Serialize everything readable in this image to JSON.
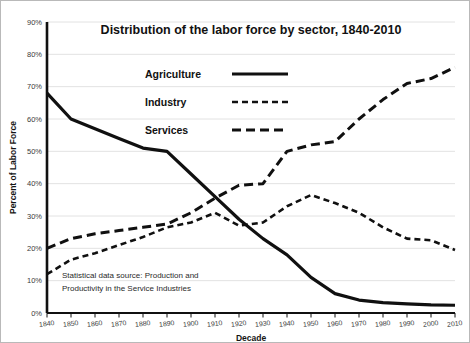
{
  "chart_data": {
    "type": "line",
    "title": "Distribution of the labor force by sector, 1840-2010",
    "xlabel": "Decade",
    "ylabel": "Percent of Labor Force",
    "xlim": [
      1840,
      2010
    ],
    "ylim": [
      0,
      90
    ],
    "ytick_step": 10,
    "grid": true,
    "legend_position": "center-top",
    "x": [
      1840,
      1850,
      1860,
      1870,
      1880,
      1890,
      1900,
      1910,
      1920,
      1930,
      1940,
      1950,
      1960,
      1970,
      1980,
      1990,
      2000,
      2010
    ],
    "xtick_labels": [
      "1840",
      "1850",
      "1860",
      "1870",
      "1880",
      "1890",
      "1900",
      "1910",
      "1920",
      "1930",
      "1940",
      "1950",
      "1960",
      "1970",
      "1980",
      "1990",
      "2000",
      "2010"
    ],
    "ytick_labels": [
      "0%",
      "10%",
      "20%",
      "30%",
      "40%",
      "50%",
      "60%",
      "70%",
      "80%",
      "90%"
    ],
    "annotation": "Statistical data source:  Production and Productivity in the Service Industries",
    "annotation_lines": [
      "Statistical data source:  Production and",
      "Productivity in the Service Industries"
    ],
    "series": [
      {
        "name": "Agriculture",
        "dash": "fine",
        "stroke_width": 3.2,
        "dasharray": "0",
        "values": [
          68,
          60,
          57,
          54,
          51,
          50,
          43,
          36,
          29,
          23,
          18,
          11,
          6,
          4,
          3.2,
          2.8,
          2.5,
          2.4
        ]
      },
      {
        "name": "Industry",
        "dash": "solid",
        "stroke_width": 2.6,
        "dasharray": "6,4",
        "values": [
          12,
          16.5,
          18.5,
          21,
          23.5,
          26.5,
          28,
          31,
          27,
          28,
          33,
          36.5,
          34,
          31,
          26.5,
          23,
          22.5,
          19.5
        ]
      },
      {
        "name": "Services",
        "dash": "long",
        "stroke_width": 3.0,
        "dasharray": "9,5",
        "values": [
          20,
          23,
          24.5,
          25.5,
          26.5,
          27.5,
          31,
          35.5,
          39.5,
          40,
          50,
          52,
          53,
          60,
          66,
          71,
          72.5,
          76
        ]
      }
    ]
  },
  "legend": {
    "items": [
      {
        "label": "Agriculture",
        "style": "fine-dash"
      },
      {
        "label": "Industry",
        "style": "solid"
      },
      {
        "label": "Services",
        "style": "long-dash"
      }
    ]
  }
}
